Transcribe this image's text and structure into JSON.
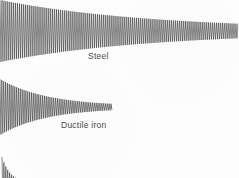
{
  "figure": {
    "background_color": "#fdfdfd",
    "trace_color": "#2b2b2b",
    "label_color": "#4a4a4a",
    "width": 239,
    "height": 178
  },
  "labels": {
    "steel": "Steel",
    "ductile_iron": "Ductile iron"
  },
  "chart_data": {
    "type": "line",
    "title": "",
    "subtitle": "",
    "xlabel": "",
    "ylabel": "",
    "grid": false,
    "legend_position": "inline-annotation",
    "axis_ranges": {
      "x_px": [
        0,
        239
      ],
      "y_px": [
        0,
        178
      ]
    },
    "series": [
      {
        "name": "Steel",
        "label": "Steel",
        "annotation": "Steel",
        "annotation_x_px": 88,
        "annotation_y_px": 52,
        "baseline_y_px": 31,
        "start_x_px": 0,
        "end_x_px": 238,
        "initial_amplitude_px": 31,
        "final_amplitude_px": 1.2,
        "decay_constant_px": 150,
        "period_px": 1.95,
        "cycles_visible": 122,
        "damping_rank": 3,
        "damping_note": "lowest damping, longest ring-down"
      },
      {
        "name": "Ductile iron",
        "label": "Ductile iron",
        "annotation": "Ductile iron",
        "annotation_x_px": 61,
        "annotation_y_px": 121,
        "baseline_y_px": 107,
        "start_x_px": 0,
        "end_x_px": 112,
        "initial_amplitude_px": 28,
        "final_amplitude_px": 0.8,
        "decay_constant_px": 46,
        "period_px": 1.85,
        "cycles_visible": 60,
        "damping_rank": 2,
        "damping_note": "moderate damping, medium ring-down"
      },
      {
        "name": "High damping alloy",
        "label": "",
        "annotation": "",
        "annotation_x_px": 0,
        "annotation_y_px": 0,
        "baseline_y_px": 183,
        "start_x_px": 2,
        "end_x_px": 26,
        "initial_amplitude_px": 26,
        "final_amplitude_px": 0.6,
        "decay_constant_px": 8,
        "period_px": 1.9,
        "cycles_visible": 13,
        "damping_rank": 1,
        "damping_note": "highest damping, cropped at bottom edge of figure"
      }
    ]
  }
}
